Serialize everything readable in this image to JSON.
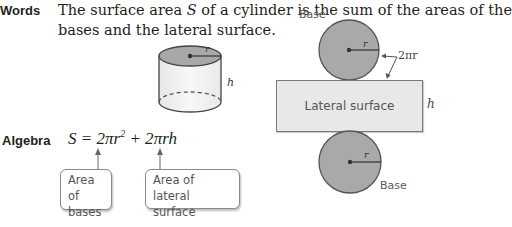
{
  "words": {
    "label": "Words",
    "line1_prefix": "The surface area ",
    "line1_var": "S",
    "line1_suffix": " of a cylinder is the sum of the areas of the",
    "line2": "bases and the lateral surface."
  },
  "cylinder": {
    "radius_label": "r",
    "height_label": "h",
    "top_fill": "#a8a8a8"
  },
  "net": {
    "top_base_label": "Base",
    "bottom_base_label": "Base",
    "radius_label": "r",
    "circumference_label": "2πr",
    "lateral_label": "Lateral surface",
    "height_label": "h",
    "circle_fill": "#a9a9a9",
    "lateral_fill": "#e8e8e8"
  },
  "algebra": {
    "label": "Algebra",
    "formula": "S = 2πr² + 2πrh",
    "callouts": [
      {
        "line1": "Area of",
        "line2": "bases"
      },
      {
        "line1": "Area of",
        "line2": "lateral surface"
      }
    ]
  }
}
